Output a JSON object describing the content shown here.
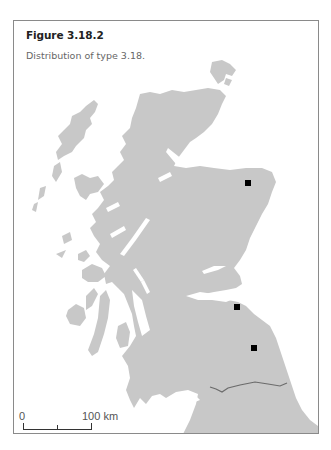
{
  "figure": {
    "title": "Figure 3.18.2",
    "caption": "Distribution of type 3.18."
  },
  "map": {
    "region": "Scotland",
    "land_color": "#c8c8c8",
    "sea_color": "#ffffff",
    "border_color": "#6b6b6b",
    "marker_color": "#000000",
    "markers": [
      {
        "id": "site-1",
        "x": 248,
        "y": 183
      },
      {
        "id": "site-2",
        "x": 237,
        "y": 307
      },
      {
        "id": "site-3",
        "x": 254,
        "y": 348
      }
    ]
  },
  "scale_bar": {
    "start_label": "0",
    "end_label": "100 km"
  }
}
